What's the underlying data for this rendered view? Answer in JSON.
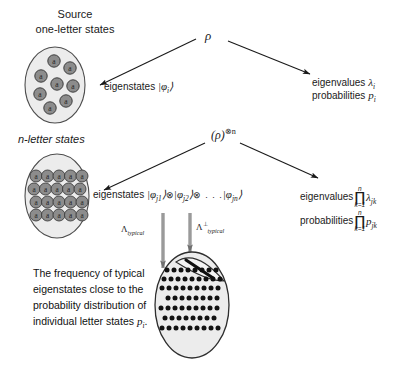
{
  "diagram": {
    "title_source": {
      "line1": "Source",
      "line2": "one-letter states"
    },
    "nletter_label": "n-letter states",
    "rho_symbol": "ρ",
    "rho_tensor_symbol": "(ρ)",
    "rho_tensor_exponent": "⊗n",
    "one_letter": {
      "eigenstates_label": "eigenstates",
      "eigenstates_ket": "|φ",
      "eigenstates_ket_sub": "i",
      "eigenstates_ket_close": "⟩",
      "eigenvalues_label": "eigenvalues",
      "eigenvalues_symbol": "λ",
      "eigenvalues_sub": "i",
      "probabilities_label": "probabilities",
      "probabilities_symbol": "p",
      "probabilities_sub": "i"
    },
    "n_letter": {
      "eigenstates_label": "eigenstates",
      "eigenstates_expr_1": "|φ",
      "eigenstates_sub_1": "j1",
      "eigenstates_tensor": "⊗",
      "eigenstates_sub_2": "j2",
      "eigenstates_dots": "⊗ . . .",
      "eigenstates_sub_n": "jn",
      "ket_close": "⟩",
      "eigenvalues_label": "eigenvalues",
      "probabilities_label": "probabilities",
      "product_glyph": "∏",
      "product_upper": "n",
      "product_lower": "k=1",
      "eigenvalue_term": "λ",
      "eigenvalue_term_sub": "jk",
      "probability_term": "p",
      "probability_term_sub": "jk"
    },
    "projectors": {
      "typical_symbol": "Λ",
      "typical_sub": "typical",
      "atypical_symbol": "Λ",
      "atypical_perp": "⊥",
      "atypical_sub": "typical"
    },
    "caption": {
      "line1": "The frequency of typical",
      "line2": "eigenstates close to the",
      "line3": "probability distribution of",
      "line4_a": "individual letter states ",
      "line4_b": "p",
      "line4_sub": "i",
      "line4_end": "."
    },
    "letter_glyph": "a",
    "colors": {
      "ellipse_fill": "#ececec",
      "ellipse_stroke": "#4d4d4d",
      "letter_fill": "#8c8c8c",
      "letter_stroke": "#3d3d3d",
      "dot_fill": "#111111",
      "arrow": "#1a1a1a",
      "text": "#1a1a1a"
    },
    "counts": {
      "source_letters": 8,
      "nletter_cols": 5,
      "nletter_rows": 4,
      "typical_dot_rows": 7
    }
  }
}
